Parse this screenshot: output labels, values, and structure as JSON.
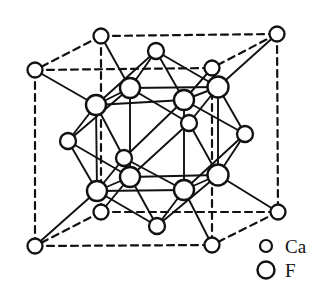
{
  "figure": {
    "name": "fluorite-unit-cell",
    "background_color": "#ffffff",
    "line_color": "#111111",
    "atom_fill_color": "#ffffff"
  },
  "legend": {
    "items": [
      {
        "label": "Ca",
        "symbol": "small-open-circle",
        "radius": 6.0
      },
      {
        "label": "F",
        "symbol": "large-open-circle",
        "radius": 8.5
      }
    ]
  },
  "atoms": {
    "ca_radius": 7.0,
    "f_radius": 9.5,
    "ca_sites": [
      {
        "id": "c-top-back-left",
        "x": 101,
        "y": 36,
        "r": 7.5
      },
      {
        "id": "c-top-back-right",
        "x": 277,
        "y": 34,
        "r": 7.5
      },
      {
        "id": "c-top-front-left",
        "x": 35,
        "y": 70,
        "r": 7.5
      },
      {
        "id": "c-top-front-right",
        "x": 212,
        "y": 68,
        "r": 7.5
      },
      {
        "id": "c-bot-back-left",
        "x": 101,
        "y": 212,
        "r": 7.5
      },
      {
        "id": "c-bot-back-right",
        "x": 278,
        "y": 212,
        "r": 7.5
      },
      {
        "id": "c-bot-front-left",
        "x": 35,
        "y": 246,
        "r": 7.5
      },
      {
        "id": "c-bot-front-right",
        "x": 212,
        "y": 245,
        "r": 7.5
      },
      {
        "id": "f-center-top",
        "x": 156,
        "y": 51,
        "r": 8.0
      },
      {
        "id": "f-center-bottom",
        "x": 157,
        "y": 226,
        "r": 8.0
      },
      {
        "id": "f-center-left",
        "x": 68,
        "y": 141,
        "r": 8.0
      },
      {
        "id": "f-center-right",
        "x": 245,
        "y": 134,
        "r": 8.0
      },
      {
        "id": "f-center-front",
        "x": 124,
        "y": 158,
        "r": 8.0
      },
      {
        "id": "f-center-back",
        "x": 189,
        "y": 123,
        "r": 8.0
      }
    ],
    "f_sites": [
      {
        "id": "f-tbl",
        "x": 130,
        "y": 88,
        "r": 10.0
      },
      {
        "id": "f-tbr",
        "x": 218,
        "y": 87,
        "r": 10.5
      },
      {
        "id": "f-tfl",
        "x": 96,
        "y": 105,
        "r": 10.0
      },
      {
        "id": "f-tfr",
        "x": 184,
        "y": 100,
        "r": 10.0
      },
      {
        "id": "f-bbl",
        "x": 130,
        "y": 177,
        "r": 10.0
      },
      {
        "id": "f-bbr",
        "x": 218,
        "y": 175,
        "r": 10.5
      },
      {
        "id": "f-bfl",
        "x": 97,
        "y": 191,
        "r": 10.0
      },
      {
        "id": "f-bfr",
        "x": 184,
        "y": 190,
        "r": 10.0
      }
    ]
  },
  "bonds": {
    "dashed_cube_edges": [
      [
        "c-top-back-left",
        "c-top-back-right"
      ],
      [
        "c-top-back-left",
        "c-top-front-left"
      ],
      [
        "c-top-back-left",
        "c-bot-back-left"
      ],
      [
        "c-top-front-left",
        "c-top-front-right"
      ],
      [
        "c-top-front-left",
        "c-bot-front-left"
      ],
      [
        "c-top-back-right",
        "c-top-front-right"
      ],
      [
        "c-top-back-right",
        "c-bot-back-right"
      ],
      [
        "c-top-front-right",
        "c-bot-front-right"
      ],
      [
        "c-bot-back-left",
        "c-bot-back-right"
      ],
      [
        "c-bot-back-left",
        "c-bot-front-left"
      ],
      [
        "c-bot-front-left",
        "c-bot-front-right"
      ],
      [
        "c-bot-back-right",
        "c-bot-front-right"
      ]
    ],
    "solid_ca_f_bonds": [
      [
        "c-top-back-left",
        "f-tbl"
      ],
      [
        "c-top-back-right",
        "f-tbr"
      ],
      [
        "c-top-front-left",
        "f-tfl"
      ],
      [
        "c-top-front-right",
        "f-tfr"
      ],
      [
        "c-bot-back-left",
        "f-bbl"
      ],
      [
        "c-bot-back-right",
        "f-bbr"
      ],
      [
        "c-bot-front-left",
        "f-bfl"
      ],
      [
        "c-bot-front-right",
        "f-bfr"
      ],
      [
        "f-center-top",
        "f-tbl"
      ],
      [
        "f-center-top",
        "f-tbr"
      ],
      [
        "f-center-top",
        "f-tfl"
      ],
      [
        "f-center-top",
        "f-tfr"
      ],
      [
        "f-center-bottom",
        "f-bbl"
      ],
      [
        "f-center-bottom",
        "f-bbr"
      ],
      [
        "f-center-bottom",
        "f-bfl"
      ],
      [
        "f-center-bottom",
        "f-bfr"
      ],
      [
        "f-center-left",
        "f-tbl"
      ],
      [
        "f-center-left",
        "f-tfl"
      ],
      [
        "f-center-left",
        "f-bbl"
      ],
      [
        "f-center-left",
        "f-bfl"
      ],
      [
        "f-center-right",
        "f-tbr"
      ],
      [
        "f-center-right",
        "f-tfr"
      ],
      [
        "f-center-right",
        "f-bbr"
      ],
      [
        "f-center-right",
        "f-bfr"
      ],
      [
        "f-center-front",
        "f-tfl"
      ],
      [
        "f-center-front",
        "f-tfr"
      ],
      [
        "f-center-front",
        "f-bfl"
      ],
      [
        "f-center-front",
        "f-bfr"
      ],
      [
        "f-center-back",
        "f-tbl"
      ],
      [
        "f-center-back",
        "f-tbr"
      ],
      [
        "f-center-back",
        "f-bbl"
      ],
      [
        "f-center-back",
        "f-bbr"
      ]
    ],
    "f_cube_edges": [
      [
        "f-tbl",
        "f-tbr"
      ],
      [
        "f-tbl",
        "f-tfl"
      ],
      [
        "f-tbl",
        "f-bbl"
      ],
      [
        "f-tfl",
        "f-tfr"
      ],
      [
        "f-tfl",
        "f-bfl"
      ],
      [
        "f-tbr",
        "f-tfr"
      ],
      [
        "f-tbr",
        "f-bbr"
      ],
      [
        "f-tfr",
        "f-bfr"
      ],
      [
        "f-bbl",
        "f-bbr"
      ],
      [
        "f-bbl",
        "f-bfl"
      ],
      [
        "f-bfl",
        "f-bfr"
      ],
      [
        "f-bbr",
        "f-bfr"
      ]
    ]
  },
  "legend_layout": {
    "ca_circle": {
      "x": 266,
      "y": 246,
      "r": 6.0
    },
    "f_circle": {
      "x": 266,
      "y": 270,
      "r": 8.5
    },
    "ca_text": {
      "x": 285,
      "y": 253
    },
    "f_text": {
      "x": 285,
      "y": 277
    }
  }
}
